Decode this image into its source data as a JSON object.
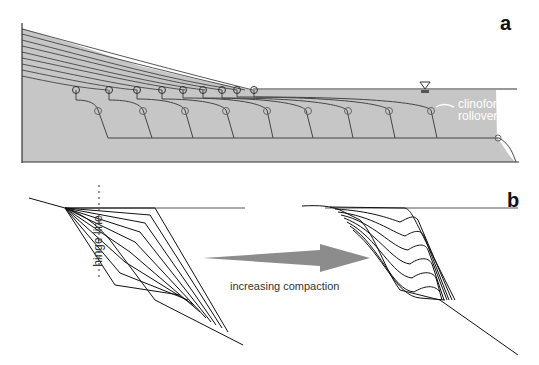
{
  "panels": {
    "a": {
      "label": "a",
      "annotation": [
        "clinoform",
        "rollover"
      ],
      "sea_level_symbol": "inverted-triangle",
      "fill_color": "#c4c4c4",
      "line_color": "#333333",
      "marker_color": "#555555"
    },
    "b": {
      "label": "b",
      "hinge_label": "hinge line",
      "arrow_label": "increasing compaction",
      "arrow_color": "#8a8a8a"
    }
  }
}
